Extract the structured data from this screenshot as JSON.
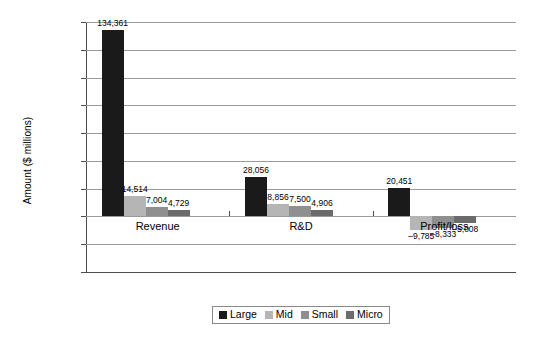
{
  "chart_data": {
    "type": "bar",
    "title": "",
    "xlabel": "",
    "ylabel": "Amount ($ millions)",
    "categories": [
      "Revenue",
      "R&D",
      "Profit/loss"
    ],
    "series": [
      {
        "name": "Large",
        "color": "#1a1a1a",
        "values": [
          134361,
          28056,
          20451
        ],
        "labels": [
          "134,361",
          "28,056",
          "20,451"
        ]
      },
      {
        "name": "Mid",
        "color": "#b5b5b5",
        "values": [
          14514,
          8856,
          -9785
        ],
        "labels": [
          "14,514",
          "8,856",
          "–9,785"
        ]
      },
      {
        "name": "Small",
        "color": "#8f8f8f",
        "values": [
          7004,
          7500,
          -8333
        ],
        "labels": [
          "7,004",
          "7,500",
          "–8,333"
        ]
      },
      {
        "name": "Micro",
        "color": "#6b6b6b",
        "values": [
          4729,
          4906,
          -5008
        ],
        "labels": [
          "4,729",
          "4,906",
          "–5,008"
        ]
      }
    ],
    "ylim": [
      -20000,
      160000
    ],
    "ytick_labels": [
      "160,000",
      "140,000",
      "120,000",
      "100,000",
      "120,000",
      "80,000",
      "60,000",
      "40,000",
      "20,000",
      "–20,000"
    ],
    "ytick_values": [
      160000,
      140000,
      120000,
      100000,
      80000,
      60000,
      40000,
      20000,
      0,
      -20000
    ],
    "grid": true,
    "legend_position": "bottom"
  },
  "legend": {
    "items": [
      {
        "label": "Large"
      },
      {
        "label": "Mid"
      },
      {
        "label": "Small"
      },
      {
        "label": "Micro"
      }
    ]
  }
}
